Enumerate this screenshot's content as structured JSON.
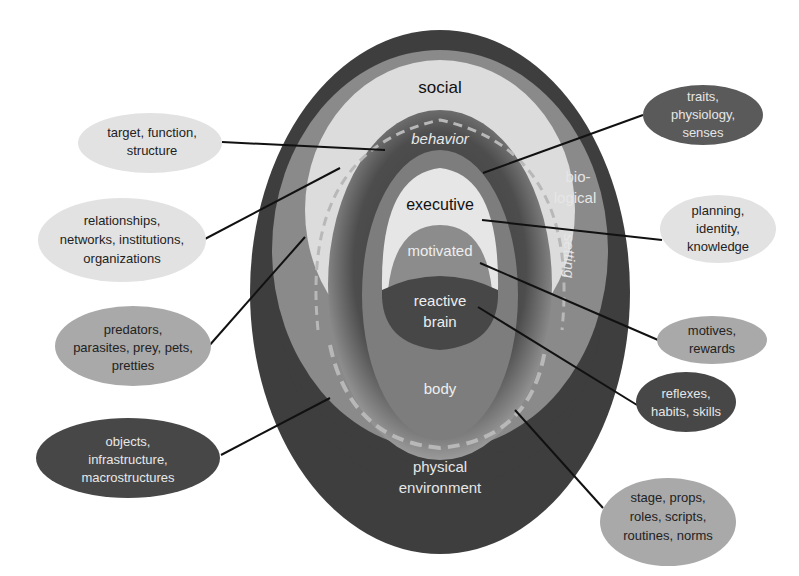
{
  "diagram": {
    "layers": {
      "social": "social",
      "behavior": "behavior",
      "biological_1": "bio-",
      "biological_2": "logical",
      "setting": "setting",
      "executive": "executive",
      "motivated": "motivated",
      "reactive_1": "reactive",
      "reactive_2": "brain",
      "body": "body",
      "physical_1": "physical",
      "physical_2": "environment"
    },
    "callouts": {
      "target": [
        "target, function,",
        "structure"
      ],
      "relationships": [
        "relationships,",
        "networks, institutions,",
        "organizations"
      ],
      "predators": [
        "predators,",
        "parasites, prey, pets,",
        "pretties"
      ],
      "objects": [
        "objects,",
        "infrastructure,",
        "macrostructures"
      ],
      "traits": [
        "traits,",
        "physiology,",
        "senses"
      ],
      "planning": [
        "planning,",
        "identity,",
        "knowledge"
      ],
      "motives": [
        "motives,",
        "rewards"
      ],
      "reflexes": [
        "reflexes,",
        "habits, skills"
      ],
      "stage": [
        "stage, props,",
        "roles, scripts,",
        "routines, norms"
      ]
    },
    "colors": {
      "outer_dark": "#3e3e3e",
      "social_mid": "#8a8a8a",
      "social_light": "#dcdcdc",
      "behavior_ring": "#4a4a4a",
      "body_gray": "#7d7d7d",
      "executive_light": "#e6e6e6",
      "motivated_gray": "#8c8c8c",
      "reactive_dark": "#474747",
      "bubble_light": "#e2e2e2",
      "bubble_mid": "#a9a9a9",
      "bubble_dark": "#474747"
    }
  }
}
